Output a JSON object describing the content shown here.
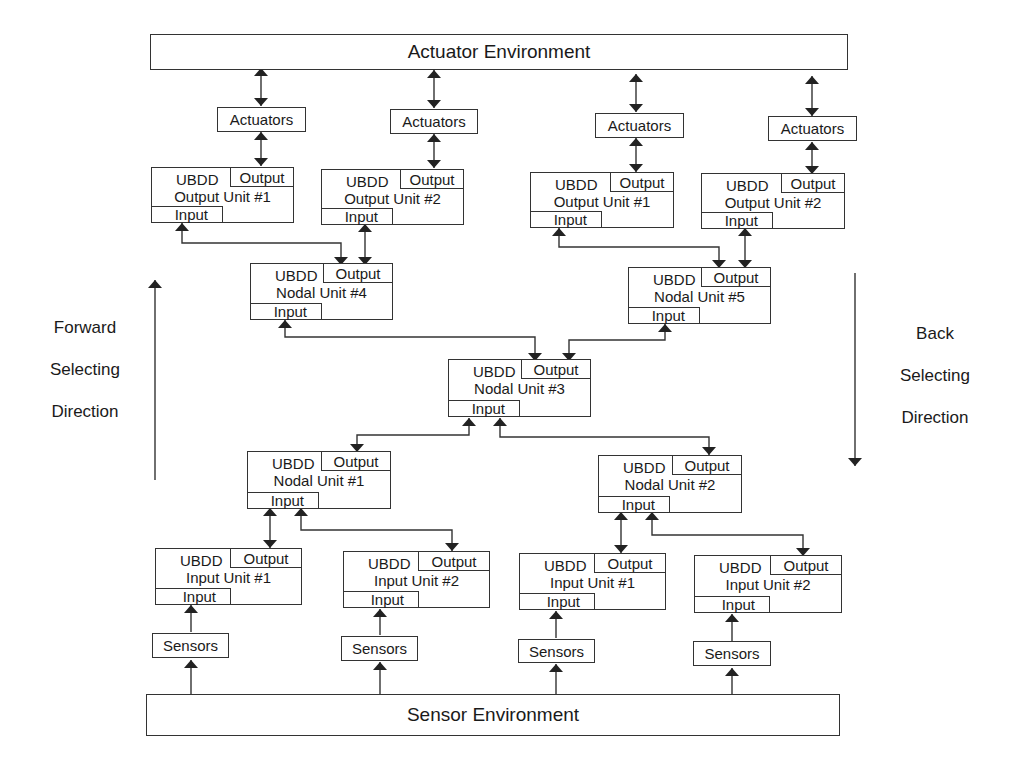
{
  "environments": {
    "actuator": "Actuator Environment",
    "sensor": "Sensor Environment"
  },
  "actuators": [
    {
      "label": "Actuators"
    },
    {
      "label": "Actuators"
    },
    {
      "label": "Actuators"
    },
    {
      "label": "Actuators"
    }
  ],
  "sensors": [
    {
      "label": "Sensors"
    },
    {
      "label": "Sensors"
    },
    {
      "label": "Sensors"
    },
    {
      "label": "Sensors"
    }
  ],
  "ports": {
    "ubdd": "UBDD",
    "output": "Output",
    "input": "Input"
  },
  "output_units": [
    {
      "name": "Output Unit #1"
    },
    {
      "name": "Output Unit #2"
    },
    {
      "name": "Output Unit #1"
    },
    {
      "name": "Output Unit #2"
    }
  ],
  "nodal_units": {
    "n4": "Nodal Unit #4",
    "n5": "Nodal Unit #5",
    "n3": "Nodal Unit #3",
    "n1": "Nodal Unit #1",
    "n2": "Nodal Unit #2"
  },
  "input_units": [
    {
      "name": "Input Unit #1"
    },
    {
      "name": "Input Unit #2"
    },
    {
      "name": "Input Unit #1"
    },
    {
      "name": "Input Unit #2"
    }
  ],
  "directions": {
    "forward": [
      "Forward",
      "Selecting",
      "Direction"
    ],
    "back": [
      "Back",
      "Selecting",
      "Direction"
    ]
  },
  "colors": {
    "line": "#333333",
    "background": "#ffffff"
  }
}
